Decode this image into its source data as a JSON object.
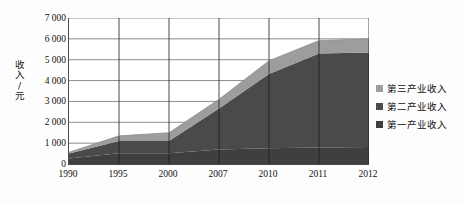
{
  "chart_data": {
    "type": "area",
    "stacked": true,
    "title": "",
    "xlabel": "",
    "ylabel": "收入/元",
    "categories": [
      "1990",
      "1995",
      "2000",
      "2007",
      "2010",
      "2011",
      "2012"
    ],
    "ylim": [
      0,
      7000
    ],
    "ytick_labels": [
      "0",
      "1 000",
      "2 000",
      "3 000",
      "4 000",
      "5 000",
      "6 000",
      "7 000"
    ],
    "ytick_values": [
      0,
      1000,
      2000,
      3000,
      4000,
      5000,
      6000,
      7000
    ],
    "grid": "horizontal-and-vertical",
    "legend_position": "right",
    "series": [
      {
        "name": "第一产业收入",
        "color": "#3f3f3f",
        "values": [
          260,
          520,
          520,
          700,
          760,
          790,
          820
        ]
      },
      {
        "name": "第二产业收入",
        "color": "#4a4a4a",
        "values": [
          240,
          580,
          580,
          1960,
          3550,
          4510,
          4530
        ]
      },
      {
        "name": "第三产业收入",
        "color": "#9d9d9d",
        "values": [
          60,
          250,
          400,
          440,
          640,
          620,
          650
        ]
      }
    ],
    "series_totals": [
      560,
      1350,
      1500,
      3100,
      4950,
      5920,
      6000
    ],
    "legend_entries": [
      {
        "label": "第三产业收入",
        "color": "#9d9d9d"
      },
      {
        "label": "第二产业收入",
        "color": "#4a4a4a"
      },
      {
        "label": "第一产业收入",
        "color": "#3f3f3f"
      }
    ],
    "axis_color": "#4a4a4a",
    "gridline_color": "#6e6e6e",
    "plot_background": "#ffffff"
  }
}
